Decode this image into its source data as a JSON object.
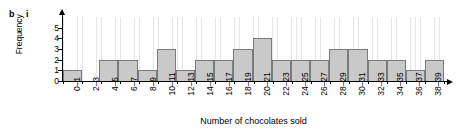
{
  "figure": {
    "part_label": "b",
    "subpart_label": "i"
  },
  "chart_data": {
    "type": "bar",
    "title": "",
    "subtitle": "",
    "xlabel": "Number of chocolates sold",
    "ylabel": "Frequency",
    "categories": [
      "0–1",
      "2–3",
      "4–5",
      "6–7",
      "8–9",
      "10–11",
      "12–13",
      "14–15",
      "16–17",
      "18–19",
      "20–21",
      "22–23",
      "24–25",
      "26–27",
      "28–29",
      "30–31",
      "32–33",
      "34–35",
      "36–37",
      "38–39"
    ],
    "values": [
      1,
      0,
      2,
      2,
      1,
      3,
      1,
      2,
      2,
      3,
      4,
      2,
      2,
      2,
      3,
      3,
      2,
      2,
      1,
      2
    ],
    "ylim": [
      0,
      6
    ],
    "yticks": [
      "0",
      "1",
      "2",
      "3",
      "4",
      "5"
    ],
    "grid": true,
    "legend": false,
    "bar_fill_color": "#c9c9c9",
    "bar_edge_color": "#7a7a7a",
    "axis_color": "#000000",
    "grid_color": "#d9d9d9"
  }
}
